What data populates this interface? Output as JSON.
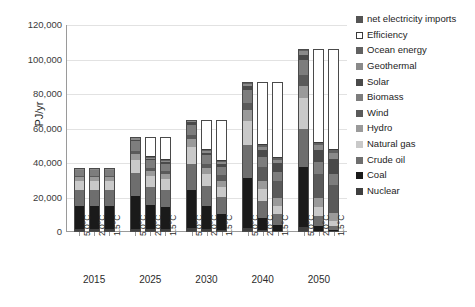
{
  "chart_data": {
    "type": "bar",
    "subtype": "stacked-bar-grouped",
    "title": "",
    "xlabel": "",
    "ylabel": "PJ/yr",
    "ylim": [
      0,
      120000
    ],
    "ytick_values": [
      0,
      20000,
      40000,
      60000,
      80000,
      100000,
      120000
    ],
    "ytick_labels": [
      "0",
      "20,000",
      "40,000",
      "60,000",
      "80,000",
      "100,000",
      "120,000"
    ],
    "grid": true,
    "legend_position": "right",
    "groups": [
      "2015",
      "2025",
      "2030",
      "2040",
      "2050"
    ],
    "scenarios": [
      "5.0°C",
      "2.0°C",
      "1.5°C"
    ],
    "series": [
      {
        "name": "Nuclear",
        "color": "#3f3f3f"
      },
      {
        "name": "Coal",
        "color": "#1a1a1a"
      },
      {
        "name": "Crude oil",
        "color": "#6e6e6e"
      },
      {
        "name": "Natural gas",
        "color": "#c9c9c9"
      },
      {
        "name": "Hydro",
        "color": "#9a9a9a"
      },
      {
        "name": "Wind",
        "color": "#5a5a5a"
      },
      {
        "name": "Biomass",
        "color": "#7d7d7d"
      },
      {
        "name": "Solar",
        "color": "#4a4a4a"
      },
      {
        "name": "Geothermal",
        "color": "#8a8a8a"
      },
      {
        "name": "Ocean energy",
        "color": "#616161"
      },
      {
        "name": "Efficiency",
        "color": "#ffffff"
      },
      {
        "name": "net electricity imports",
        "color": "#545454"
      }
    ],
    "bars": [
      {
        "group": "2015",
        "scenario": "5.0°C",
        "total": 37000,
        "values": {
          "Nuclear": 1500,
          "Coal": 13500,
          "Crude oil": 9500,
          "Natural gas": 5000,
          "Hydro": 2500,
          "Wind": 500,
          "Biomass": 3500,
          "Solar": 300,
          "Geothermal": 400,
          "Ocean energy": 300,
          "Efficiency": 0,
          "net electricity imports": 0
        }
      },
      {
        "group": "2015",
        "scenario": "2.0°C",
        "total": 37000,
        "values": {
          "Nuclear": 1500,
          "Coal": 13500,
          "Crude oil": 9500,
          "Natural gas": 5000,
          "Hydro": 2500,
          "Wind": 500,
          "Biomass": 3500,
          "Solar": 300,
          "Geothermal": 400,
          "Ocean energy": 300,
          "Efficiency": 0,
          "net electricity imports": 0
        }
      },
      {
        "group": "2015",
        "scenario": "1.5°C",
        "total": 37000,
        "values": {
          "Nuclear": 1500,
          "Coal": 13500,
          "Crude oil": 9500,
          "Natural gas": 5000,
          "Hydro": 2500,
          "Wind": 500,
          "Biomass": 3500,
          "Solar": 300,
          "Geothermal": 400,
          "Ocean energy": 300,
          "Efficiency": 0,
          "net electricity imports": 0
        }
      },
      {
        "group": "2025",
        "scenario": "5.0°C",
        "total": 55000,
        "values": {
          "Nuclear": 2000,
          "Coal": 19000,
          "Crude oil": 13000,
          "Natural gas": 8000,
          "Hydro": 3500,
          "Wind": 1500,
          "Biomass": 5500,
          "Solar": 1000,
          "Geothermal": 900,
          "Ocean energy": 600,
          "Efficiency": 0,
          "net electricity imports": 0
        }
      },
      {
        "group": "2025",
        "scenario": "2.0°C",
        "total": 55000,
        "values": {
          "Nuclear": 1500,
          "Coal": 14000,
          "Crude oil": 10500,
          "Natural gas": 6500,
          "Hydro": 3000,
          "Wind": 1500,
          "Biomass": 4500,
          "Solar": 900,
          "Geothermal": 700,
          "Ocean energy": 400,
          "Efficiency": 11500,
          "net electricity imports": 0
        }
      },
      {
        "group": "2025",
        "scenario": "1.5°C",
        "total": 55000,
        "values": {
          "Nuclear": 1500,
          "Coal": 13000,
          "Crude oil": 10000,
          "Natural gas": 6000,
          "Hydro": 3000,
          "Wind": 1600,
          "Biomass": 4400,
          "Solar": 900,
          "Geothermal": 700,
          "Ocean energy": 400,
          "Efficiency": 13500,
          "net electricity imports": 0
        }
      },
      {
        "group": "2030",
        "scenario": "5.0°C",
        "total": 65000,
        "values": {
          "Nuclear": 2200,
          "Coal": 22000,
          "Crude oil": 15000,
          "Natural gas": 10000,
          "Hydro": 4500,
          "Wind": 2500,
          "Biomass": 6000,
          "Solar": 1300,
          "Geothermal": 1000,
          "Ocean energy": 500,
          "Efficiency": 0,
          "net electricity imports": 0
        }
      },
      {
        "group": "2030",
        "scenario": "2.0°C",
        "total": 65000,
        "values": {
          "Nuclear": 1500,
          "Coal": 13500,
          "Crude oil": 11500,
          "Natural gas": 7000,
          "Hydro": 3500,
          "Wind": 2500,
          "Biomass": 5000,
          "Solar": 1500,
          "Geothermal": 900,
          "Ocean energy": 600,
          "Efficiency": 17500,
          "net electricity imports": 0
        }
      },
      {
        "group": "2030",
        "scenario": "1.5°C",
        "total": 65000,
        "values": {
          "Nuclear": 1300,
          "Coal": 9000,
          "Crude oil": 10000,
          "Natural gas": 6000,
          "Hydro": 3500,
          "Wind": 3000,
          "Biomass": 5000,
          "Solar": 1800,
          "Geothermal": 900,
          "Ocean energy": 500,
          "Efficiency": 24000,
          "net electricity imports": 0
        }
      },
      {
        "group": "2040",
        "scenario": "5.0°C",
        "total": 87000,
        "values": {
          "Nuclear": 2500,
          "Coal": 29000,
          "Crude oil": 19000,
          "Natural gas": 14000,
          "Hydro": 6000,
          "Wind": 4500,
          "Biomass": 7500,
          "Solar": 2000,
          "Geothermal": 1500,
          "Ocean energy": 1000,
          "Efficiency": 0,
          "net electricity imports": 0
        }
      },
      {
        "group": "2040",
        "scenario": "2.0°C",
        "total": 87000,
        "values": {
          "Nuclear": 1200,
          "Coal": 7000,
          "Crude oil": 10000,
          "Natural gas": 7000,
          "Hydro": 4500,
          "Wind": 8000,
          "Biomass": 6000,
          "Solar": 4000,
          "Geothermal": 1500,
          "Ocean energy": 1000,
          "Efficiency": 36800,
          "net electricity imports": 0
        }
      },
      {
        "group": "2040",
        "scenario": "1.5°C",
        "total": 87000,
        "values": {
          "Nuclear": 800,
          "Coal": 3000,
          "Crude oil": 6500,
          "Natural gas": 5000,
          "Hydro": 4500,
          "Wind": 9500,
          "Biomass": 5500,
          "Solar": 5000,
          "Geothermal": 1700,
          "Ocean energy": 1200,
          "Efficiency": 44300,
          "net electricity imports": 0
        }
      },
      {
        "group": "2050",
        "scenario": "5.0°C",
        "total": 106000,
        "values": {
          "Nuclear": 2800,
          "Coal": 35000,
          "Crude oil": 22000,
          "Natural gas": 18000,
          "Hydro": 7000,
          "Wind": 6500,
          "Biomass": 8500,
          "Solar": 3000,
          "Geothermal": 2000,
          "Ocean energy": 1200,
          "Efficiency": 0,
          "net electricity imports": 0
        }
      },
      {
        "group": "2050",
        "scenario": "2.0°C",
        "total": 106000,
        "values": {
          "Nuclear": 700,
          "Coal": 2500,
          "Crude oil": 6000,
          "Natural gas": 5500,
          "Hydro": 5000,
          "Wind": 14000,
          "Biomass": 7000,
          "Solar": 7000,
          "Geothermal": 2500,
          "Ocean energy": 1500,
          "Efficiency": 54300,
          "net electricity imports": 0
        }
      },
      {
        "group": "2050",
        "scenario": "1.5°C",
        "total": 106000,
        "values": {
          "Nuclear": 300,
          "Coal": 800,
          "Crude oil": 2500,
          "Natural gas": 2500,
          "Hydro": 5000,
          "Wind": 16000,
          "Biomass": 6500,
          "Solar": 9000,
          "Geothermal": 3000,
          "Ocean energy": 1800,
          "Efficiency": 58600,
          "net electricity imports": 0
        }
      }
    ]
  },
  "legend": {
    "items": [
      {
        "label": "net electricity imports",
        "color": "#545454",
        "outlined": false
      },
      {
        "label": "Efficiency",
        "color": "#ffffff",
        "outlined": true
      },
      {
        "label": "Ocean energy",
        "color": "#616161",
        "outlined": false
      },
      {
        "label": "Geothermal",
        "color": "#8a8a8a",
        "outlined": false
      },
      {
        "label": "Solar",
        "color": "#4a4a4a",
        "outlined": false
      },
      {
        "label": "Biomass",
        "color": "#7d7d7d",
        "outlined": false
      },
      {
        "label": "Wind",
        "color": "#5a5a5a",
        "outlined": false
      },
      {
        "label": "Hydro",
        "color": "#9a9a9a",
        "outlined": false
      },
      {
        "label": "Natural gas",
        "color": "#c9c9c9",
        "outlined": false
      },
      {
        "label": "Crude oil",
        "color": "#6e6e6e",
        "outlined": false
      },
      {
        "label": "Coal",
        "color": "#1a1a1a",
        "outlined": false
      },
      {
        "label": "Nuclear",
        "color": "#3f3f3f",
        "outlined": false
      }
    ]
  },
  "axes": {
    "y_title": "PJ/yr"
  }
}
